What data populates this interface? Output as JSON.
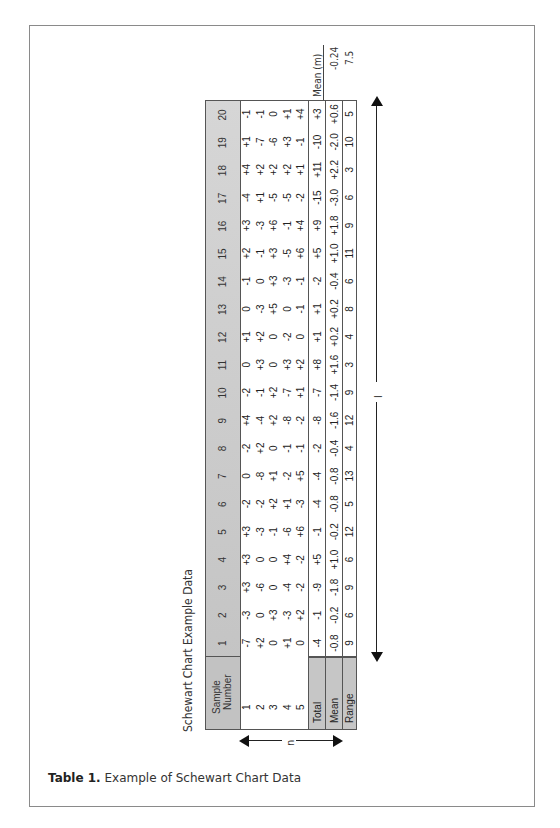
{
  "table": {
    "title": "Schewart Chart Example Data",
    "header_label_line1": "Sample",
    "header_label_line2": "Number",
    "sample_numbers": [
      "1",
      "2",
      "3",
      "4",
      "5",
      "6",
      "7",
      "8",
      "9",
      "10",
      "11",
      "12",
      "13",
      "14",
      "15",
      "16",
      "17",
      "18",
      "19",
      "20"
    ],
    "row_labels": [
      "1",
      "2",
      "3",
      "4",
      "5"
    ],
    "rows": [
      [
        "-7",
        "-3",
        "+3",
        "+3",
        "+3",
        "-2",
        "0",
        "-2",
        "+4",
        "-2",
        "0",
        "+1",
        "0",
        "-1",
        "+2",
        "+3",
        "-4",
        "+4",
        "+1",
        "-1"
      ],
      [
        "+2",
        "0",
        "-6",
        "0",
        "-3",
        "-2",
        "-8",
        "+2",
        "-4",
        "-1",
        "+3",
        "+2",
        "-3",
        "0",
        "-1",
        "-3",
        "+1",
        "+2",
        "-7",
        "-1"
      ],
      [
        "0",
        "+3",
        "0",
        "0",
        "-1",
        "+2",
        "+1",
        "0",
        "+2",
        "+2",
        "0",
        "0",
        "+5",
        "+3",
        "+3",
        "+6",
        "-5",
        "+2",
        "-6",
        "0"
      ],
      [
        "+1",
        "-3",
        "-4",
        "+4",
        "-6",
        "+1",
        "-2",
        "-1",
        "-8",
        "-7",
        "+3",
        "-2",
        "0",
        "-3",
        "-5",
        "-1",
        "-5",
        "+2",
        "+3",
        "+1"
      ],
      [
        "0",
        "+2",
        "-2",
        "-2",
        "+6",
        "-3",
        "+5",
        "-1",
        "-2",
        "+1",
        "+2",
        "0",
        "-1",
        "-1",
        "+6",
        "+4",
        "-2",
        "+1",
        "-1",
        "+4"
      ]
    ],
    "total_label": "Total",
    "totals": [
      "-4",
      "-1",
      "-9",
      "+5",
      "-1",
      "-4",
      "-4",
      "-2",
      "-8",
      "-7",
      "+8",
      "+1",
      "+1",
      "-2",
      "+5",
      "+9",
      "-15",
      "+11",
      "-10",
      "+3"
    ],
    "mean_label": "Mean",
    "means": [
      "-0.8",
      "-0.2",
      "-1.8",
      "+1.0",
      "-0.2",
      "-0.8",
      "-0.8",
      "-0.4",
      "-1.6",
      "-1.4",
      "+1.6",
      "+0.2",
      "+0.2",
      "-0.4",
      "+1.0",
      "+1.8",
      "-3.0",
      "+2.2",
      "-2.0",
      "+0.6"
    ],
    "range_label": "Range",
    "ranges": [
      "9",
      "6",
      "9",
      "6",
      "12",
      "5",
      "13",
      "4",
      "12",
      "9",
      "3",
      "4",
      "8",
      "6",
      "11",
      "9",
      "6",
      "3",
      "10",
      "5"
    ]
  },
  "grand_mean": {
    "label": "Mean (m)",
    "mean_value": "-0.24",
    "range_value": "7.5"
  },
  "annotations": {
    "l_label": "l",
    "n_label": "n"
  },
  "caption": {
    "number": "Table 1.",
    "text": "Example of Schewart Chart Data"
  },
  "colors": {
    "header_gray": "#c6c6c6",
    "border": "#555555"
  }
}
